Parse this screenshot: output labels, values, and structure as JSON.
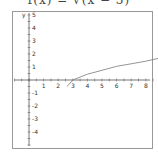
{
  "title": "f(x) = √(x − 3)",
  "chart_data": {
    "type": "line",
    "title": "f(x) = √(x − 3)",
    "xlabel": "x",
    "ylabel": "y",
    "xlim": [
      -1,
      9
    ],
    "ylim": [
      -5,
      5
    ],
    "x_ticks": [
      -1,
      1,
      2,
      3,
      4,
      5,
      6,
      7,
      8,
      9
    ],
    "y_ticks": [
      -4,
      -3,
      -2,
      -1,
      1,
      2,
      3,
      4,
      5
    ],
    "grid": false,
    "series": [
      {
        "name": "f(x)",
        "x": [
          2.6,
          3,
          4,
          5,
          6,
          7,
          8,
          9
        ],
        "values": [
          -0.5,
          0,
          0.45,
          0.75,
          1.05,
          1.25,
          1.45,
          1.7
        ]
      }
    ],
    "colors": {
      "curve": "#888888",
      "axis": "#555555",
      "frame": "#999999"
    }
  }
}
